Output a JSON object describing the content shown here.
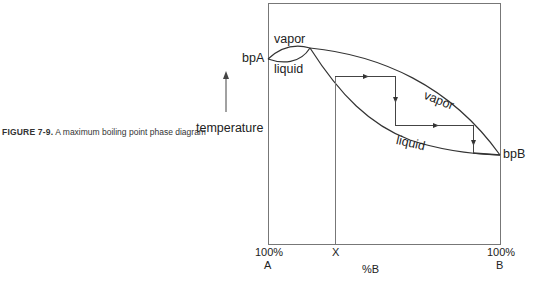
{
  "caption": {
    "figure_number": "FIGURE 7-9.",
    "text": "A maximum boiling point phase diagram"
  },
  "labels": {
    "y_axis": "temperature",
    "bpA": "bpA",
    "bpB": "bpB",
    "vapor_left": "vapor",
    "liquid_left": "liquid",
    "vapor_right": "vapor",
    "liquid_right": "liquid"
  },
  "x_axis": {
    "left_pct": "100%",
    "left_comp": "A",
    "marker": "X",
    "title": "%B",
    "right_pct": "100%",
    "right_comp": "B"
  },
  "colors": {
    "line": "#333333",
    "frame": "#777777"
  }
}
